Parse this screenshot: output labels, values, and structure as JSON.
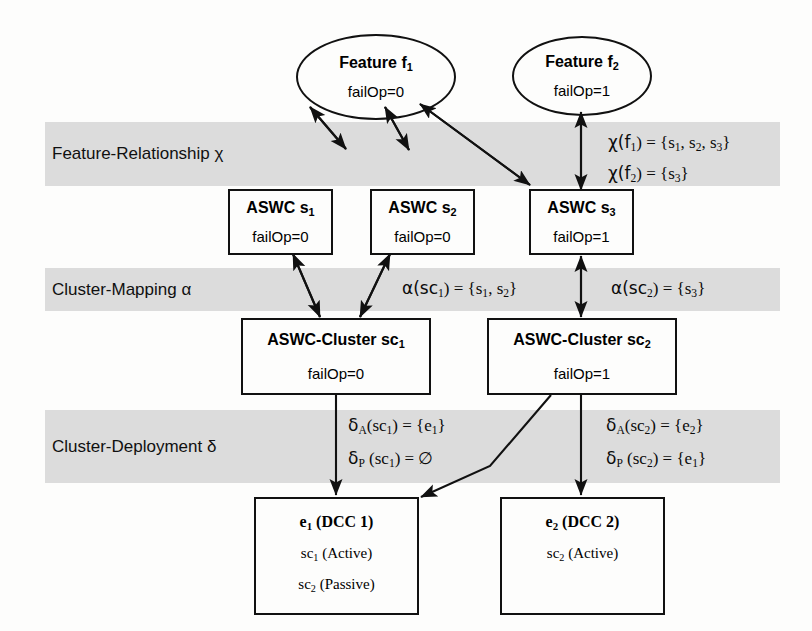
{
  "diagram": {
    "band_color": "#dcdcdc",
    "line_color": "#111111"
  },
  "bands": [
    {
      "id": "feature-relationship",
      "label": "Feature-Relationship χ"
    },
    {
      "id": "cluster-mapping",
      "label": "Cluster-Mapping α"
    },
    {
      "id": "cluster-deployment",
      "label": "Cluster-Deployment δ"
    }
  ],
  "features": [
    {
      "id": "f1",
      "title": "Feature f₁",
      "title_base": "Feature f",
      "title_sub": "1",
      "attr": "failOp=0"
    },
    {
      "id": "f2",
      "title": "Feature f₂",
      "title_base": "Feature f",
      "title_sub": "2",
      "attr": "failOp=1"
    }
  ],
  "components": [
    {
      "id": "s1",
      "title_base": "ASWC s",
      "title_sub": "1",
      "attr": "failOp=0"
    },
    {
      "id": "s2",
      "title_base": "ASWC s",
      "title_sub": "2",
      "attr": "failOp=0"
    },
    {
      "id": "s3",
      "title_base": "ASWC s",
      "title_sub": "3",
      "attr": "failOp=1"
    }
  ],
  "clusters": [
    {
      "id": "sc1",
      "title_base": "ASWC-Cluster sc",
      "title_sub": "1",
      "attr": "failOp=0"
    },
    {
      "id": "sc2",
      "title_base": "ASWC-Cluster sc",
      "title_sub": "2",
      "attr": "failOp=1"
    }
  ],
  "ecus": [
    {
      "id": "e1",
      "title_base": "e",
      "title_sub": "1",
      "title_rest": " (DCC 1)",
      "lines": [
        {
          "base": "sc",
          "sub": "1",
          "rest": " (Active)"
        },
        {
          "base": "sc",
          "sub": "2",
          "rest": " (Passive)"
        }
      ]
    },
    {
      "id": "e2",
      "title_base": "e",
      "title_sub": "2",
      "title_rest": " (DCC 2)",
      "lines": [
        {
          "base": "sc",
          "sub": "2",
          "rest": " (Active)"
        }
      ]
    }
  ],
  "annotations": {
    "chi_f1": {
      "fn": "χ(f",
      "fn_sub": "1",
      "mid": ") = {s",
      "sub_a": "1",
      "sep1": ", s",
      "sub_b": "2",
      "sep2": ", s",
      "sub_c": "3",
      "end": "}"
    },
    "chi_f2": {
      "fn": "χ(f",
      "fn_sub": "2",
      "mid": ") = {s",
      "sub_a": "3",
      "end": "}"
    },
    "alpha_sc1": {
      "fn": "α(sc",
      "fn_sub": "1",
      "mid": ") = {s",
      "sub_a": "1",
      "sep1": ", s",
      "sub_b": "2",
      "end": "}"
    },
    "alpha_sc2": {
      "fn": "α(sc",
      "fn_sub": "2",
      "mid": ") = {s",
      "sub_a": "3",
      "end": "}"
    },
    "delta_A_sc1": {
      "fn": "δ",
      "fn_sub": "A",
      "arg": "(sc",
      "arg_sub": "1",
      "mid": ") = {e",
      "val_sub": "1",
      "end": "}"
    },
    "delta_P_sc1": {
      "fn": "δ",
      "fn_sub": "P",
      "arg": " (sc",
      "arg_sub": "1",
      "mid": ") = ∅",
      "val_sub": "",
      "end": ""
    },
    "delta_A_sc2": {
      "fn": "δ",
      "fn_sub": "A",
      "arg": "(sc",
      "arg_sub": "2",
      "mid": ") = {e",
      "val_sub": "2",
      "end": "}"
    },
    "delta_P_sc2": {
      "fn": "δ",
      "fn_sub": "P",
      "arg": " (sc",
      "arg_sub": "2",
      "mid": ") = {e",
      "val_sub": "1",
      "end": "}"
    }
  }
}
